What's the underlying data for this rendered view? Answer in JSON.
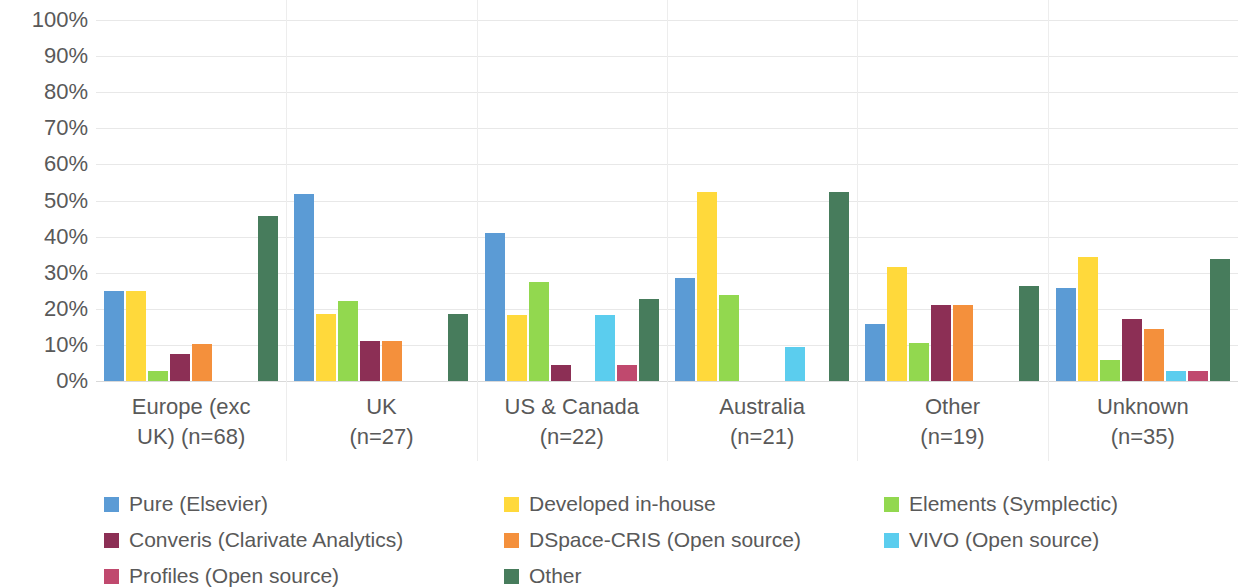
{
  "chart_data": {
    "type": "bar",
    "title": "",
    "xlabel": "",
    "ylabel": "",
    "ylim": [
      0,
      100
    ],
    "grid": true,
    "legend_position": "bottom",
    "y_ticks": [
      "0%",
      "10%",
      "20%",
      "30%",
      "40%",
      "50%",
      "60%",
      "70%",
      "80%",
      "90%",
      "100%"
    ],
    "y_tick_values": [
      0,
      10,
      20,
      30,
      40,
      50,
      60,
      70,
      80,
      90,
      100
    ],
    "categories": [
      "Europe (exc UK) (n=68)",
      "UK (n=27)",
      "US & Canada (n=22)",
      "Australia (n=21)",
      "Other (n=19)",
      "Unknown (n=35)"
    ],
    "category_lines": [
      [
        "Europe (exc",
        "UK) (n=68)"
      ],
      [
        "UK",
        "(n=27)"
      ],
      [
        "US & Canada",
        "(n=22)"
      ],
      [
        "Australia",
        "(n=21)"
      ],
      [
        "Other",
        "(n=19)"
      ],
      [
        "Unknown",
        "(n=35)"
      ]
    ],
    "series": [
      {
        "name": "Pure (Elsevier)",
        "color": "#5B9BD5",
        "values": [
          25.0,
          51.9,
          40.9,
          28.6,
          15.8,
          25.7
        ]
      },
      {
        "name": "Developed in-house",
        "color": "#FFD93B",
        "values": [
          25.0,
          18.5,
          18.2,
          52.4,
          31.6,
          34.3
        ]
      },
      {
        "name": "Elements (Symplectic)",
        "color": "#92D84F",
        "values": [
          2.9,
          22.2,
          27.3,
          23.8,
          10.5,
          5.7
        ]
      },
      {
        "name": "Converis (Clarivate Analytics)",
        "color": "#8C2F55",
        "values": [
          7.4,
          11.1,
          4.5,
          0,
          21.1,
          17.1
        ]
      },
      {
        "name": "DSpace-CRIS (Open source)",
        "color": "#F4903C",
        "values": [
          10.3,
          11.1,
          0,
          0,
          21.1,
          14.3
        ]
      },
      {
        "name": "VIVO (Open source)",
        "color": "#5BCDEE",
        "values": [
          0,
          0,
          18.2,
          9.5,
          0,
          2.9
        ]
      },
      {
        "name": "Profiles (Open source)",
        "color": "#C0496E",
        "values": [
          0,
          0,
          4.5,
          0,
          0,
          2.9
        ]
      },
      {
        "name": "Other",
        "color": "#477C5C",
        "values": [
          45.6,
          18.5,
          22.7,
          52.4,
          26.3,
          33.7
        ]
      }
    ]
  },
  "legend": {
    "items": [
      {
        "label": "Pure (Elsevier)",
        "color": "#5B9BD5"
      },
      {
        "label": "Developed in-house",
        "color": "#FFD93B"
      },
      {
        "label": "Elements (Symplectic)",
        "color": "#92D84F"
      },
      {
        "label": "Converis (Clarivate Analytics)",
        "color": "#8C2F55"
      },
      {
        "label": "DSpace-CRIS (Open source)",
        "color": "#F4903C"
      },
      {
        "label": "VIVO (Open source)",
        "color": "#5BCDEE"
      },
      {
        "label": "Profiles (Open source)",
        "color": "#C0496E"
      },
      {
        "label": "Other",
        "color": "#477C5C"
      }
    ]
  }
}
